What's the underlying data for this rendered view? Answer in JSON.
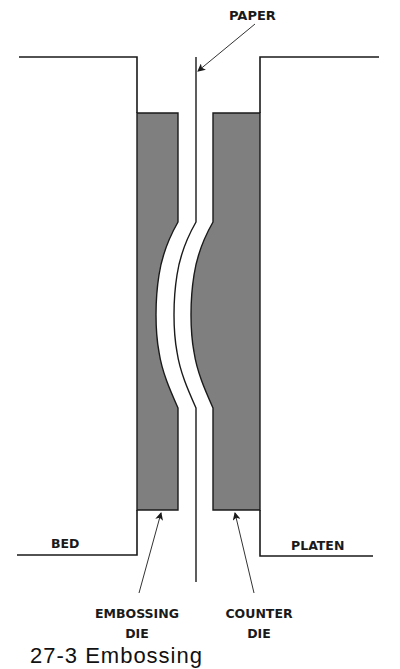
{
  "diagram": {
    "type": "embossing-press-cross-section",
    "labels": {
      "paper": "PAPER",
      "bed": "BED",
      "platen": "PLATEN",
      "embossing_die_line1": "EMBOSSING",
      "embossing_die_line2": "DIE",
      "counter_die_line1": "COUNTER",
      "counter_die_line2": "DIE"
    },
    "caption": "27-3 Embossing",
    "colors": {
      "die_fill": "#7f7f7f",
      "line": "#1a1a1a",
      "background": "#ffffff"
    }
  }
}
